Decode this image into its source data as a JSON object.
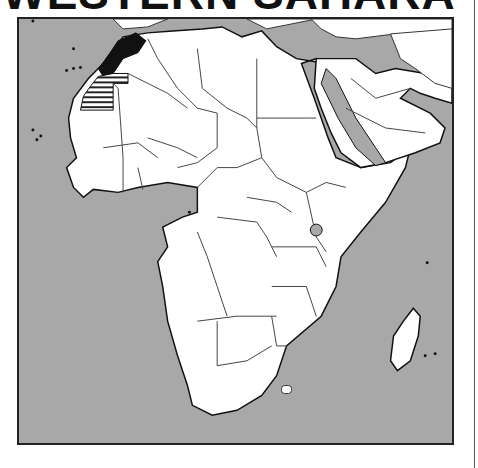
{
  "title": "WESTERN SAHARA",
  "map": {
    "region": "Africa and Middle East",
    "highlighted_country": "Western Sahara",
    "highlight_style": "horizontal stripes",
    "emphasized_neighbor": "Morocco",
    "colors": {
      "ocean": "#a8a8a8",
      "land": "#ffffff",
      "border": "#333333",
      "highlight_neighbor": "#111111",
      "frame": "#222222"
    }
  }
}
